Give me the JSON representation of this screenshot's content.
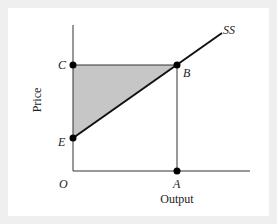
{
  "diagram": {
    "axes": {
      "x_label": "Output",
      "y_label": "Price",
      "origin_label": "O"
    },
    "curve": {
      "label": "SS",
      "color": "#111111"
    },
    "points": {
      "C": "C",
      "B": "B",
      "E": "E",
      "A": "A"
    },
    "shaded_region": {
      "vertices": [
        "C",
        "B",
        "E"
      ],
      "color": "#c6c6c6"
    }
  }
}
